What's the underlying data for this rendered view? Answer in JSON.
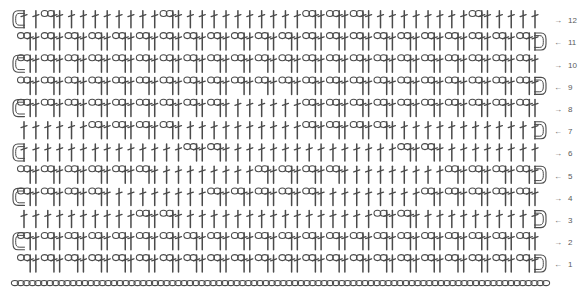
{
  "document": {
    "title": "Crochet Stitch Chart",
    "kind": "crochet-pattern-diagram",
    "background_color": "#ffffff",
    "stroke_color": "#4a4a4a",
    "label_color": "#5a5a5a"
  },
  "legend": {
    "symbols": [
      {
        "name": "chain-stitch",
        "abbr": "ch",
        "glyph": "oval",
        "label": "chain"
      },
      {
        "name": "double-crochet-stitch",
        "abbr": "dc",
        "glyph": "vertical-bar-with-crossbar",
        "label": "double crochet"
      },
      {
        "name": "turning-chain",
        "abbr": "t-ch",
        "glyph": "curved-chain-arc",
        "label": "turning chain"
      }
    ]
  },
  "chart_data": {
    "type": "diagram",
    "grid": false,
    "columns": 44,
    "row_count": 12,
    "foundation": {
      "name": "foundation-chain",
      "stitch": "ch",
      "count": 92,
      "label": "",
      "y": 283
    },
    "geometry": {
      "left_margin": 14,
      "right_margin": 545,
      "row_pitch": 22.2,
      "first_row_baseline": 272,
      "stitch_pitch": 12.05,
      "dc_height": 17,
      "chain_width": 11,
      "chain_height": 6
    },
    "row_numbers": [
      1,
      2,
      3,
      4,
      5,
      6,
      7,
      8,
      9,
      10,
      11,
      12
    ],
    "arrow_directions": [
      "left",
      "right",
      "left",
      "right",
      "left",
      "right",
      "left",
      "right",
      "left",
      "right",
      "left",
      "right"
    ],
    "arrow_glyphs": {
      "left": "←",
      "right": "→"
    },
    "rows": [
      {
        "number": 1,
        "direction": "left",
        "turn_side": "right",
        "cells": [
          "ch",
          "dc",
          "ch",
          "dc",
          "ch",
          "dc",
          "ch",
          "dc",
          "ch",
          "dc",
          "ch",
          "dc",
          "ch",
          "dc",
          "ch",
          "dc",
          "ch",
          "dc",
          "ch",
          "dc",
          "ch",
          "dc",
          "ch",
          "dc",
          "ch",
          "dc",
          "ch",
          "dc",
          "ch",
          "dc",
          "ch",
          "dc",
          "ch",
          "dc",
          "ch",
          "dc",
          "ch",
          "dc",
          "ch",
          "dc",
          "ch",
          "dc",
          "ch",
          "dc"
        ]
      },
      {
        "number": 2,
        "direction": "right",
        "turn_side": "left",
        "cells": [
          "ch",
          "dc",
          "ch",
          "dc",
          "ch",
          "dc",
          "ch",
          "dc",
          "ch",
          "dc",
          "ch",
          "dc",
          "ch",
          "dc",
          "ch",
          "dc",
          "ch",
          "dc",
          "ch",
          "dc",
          "ch",
          "dc",
          "ch",
          "dc",
          "ch",
          "dc",
          "ch",
          "dc",
          "ch",
          "dc",
          "ch",
          "dc",
          "ch",
          "dc",
          "ch",
          "dc",
          "ch",
          "dc",
          "ch",
          "dc",
          "ch",
          "dc",
          "ch",
          "dc"
        ]
      },
      {
        "number": 3,
        "direction": "left",
        "turn_side": "right",
        "cells": [
          "dc",
          "dc",
          "dc",
          "dc",
          "dc",
          "dc",
          "dc",
          "dc",
          "dc",
          "dc",
          "ch",
          "dc",
          "ch",
          "dc",
          "dc",
          "dc",
          "dc",
          "dc",
          "dc",
          "dc",
          "dc",
          "dc",
          "dc",
          "dc",
          "dc",
          "dc",
          "dc",
          "dc",
          "dc",
          "dc",
          "ch",
          "dc",
          "ch",
          "dc",
          "dc",
          "dc",
          "dc",
          "dc",
          "dc",
          "dc",
          "dc",
          "dc",
          "dc",
          "dc"
        ]
      },
      {
        "number": 4,
        "direction": "right",
        "turn_side": "left",
        "cells": [
          "ch",
          "dc",
          "ch",
          "dc",
          "ch",
          "dc",
          "ch",
          "dc",
          "dc",
          "dc",
          "dc",
          "dc",
          "dc",
          "dc",
          "dc",
          "dc",
          "ch",
          "dc",
          "ch",
          "dc",
          "ch",
          "dc",
          "ch",
          "dc",
          "ch",
          "dc",
          "dc",
          "dc",
          "dc",
          "dc",
          "dc",
          "dc",
          "dc",
          "dc",
          "ch",
          "dc",
          "ch",
          "dc",
          "ch",
          "dc",
          "ch",
          "dc",
          "ch",
          "dc"
        ]
      },
      {
        "number": 5,
        "direction": "left",
        "turn_side": "right",
        "cells": [
          "ch",
          "dc",
          "ch",
          "dc",
          "ch",
          "dc",
          "ch",
          "dc",
          "ch",
          "dc",
          "ch",
          "dc",
          "dc",
          "dc",
          "dc",
          "dc",
          "dc",
          "dc",
          "dc",
          "dc",
          "ch",
          "dc",
          "ch",
          "dc",
          "ch",
          "dc",
          "ch",
          "dc",
          "dc",
          "dc",
          "dc",
          "dc",
          "dc",
          "dc",
          "dc",
          "dc",
          "ch",
          "dc",
          "ch",
          "dc",
          "ch",
          "dc",
          "ch",
          "dc"
        ]
      },
      {
        "number": 6,
        "direction": "right",
        "turn_side": "left",
        "cells": [
          "dc",
          "dc",
          "dc",
          "dc",
          "dc",
          "dc",
          "dc",
          "dc",
          "dc",
          "dc",
          "dc",
          "dc",
          "dc",
          "dc",
          "ch",
          "dc",
          "ch",
          "dc",
          "dc",
          "dc",
          "dc",
          "dc",
          "dc",
          "dc",
          "dc",
          "dc",
          "dc",
          "dc",
          "dc",
          "dc",
          "dc",
          "dc",
          "ch",
          "dc",
          "ch",
          "dc",
          "dc",
          "dc",
          "dc",
          "dc",
          "dc",
          "dc",
          "dc",
          "dc"
        ]
      },
      {
        "number": 7,
        "direction": "left",
        "turn_side": "right",
        "cells": [
          "dc",
          "dc",
          "dc",
          "dc",
          "dc",
          "dc",
          "ch",
          "dc",
          "ch",
          "dc",
          "ch",
          "dc",
          "ch",
          "dc",
          "dc",
          "dc",
          "dc",
          "dc",
          "dc",
          "dc",
          "dc",
          "dc",
          "dc",
          "dc",
          "ch",
          "dc",
          "ch",
          "dc",
          "ch",
          "dc",
          "ch",
          "dc",
          "dc",
          "dc",
          "dc",
          "dc",
          "dc",
          "dc",
          "dc",
          "dc",
          "dc",
          "dc",
          "dc",
          "dc"
        ]
      },
      {
        "number": 8,
        "direction": "right",
        "turn_side": "left",
        "cells": [
          "ch",
          "dc",
          "ch",
          "dc",
          "ch",
          "dc",
          "ch",
          "dc",
          "ch",
          "dc",
          "ch",
          "dc",
          "ch",
          "dc",
          "ch",
          "dc",
          "ch",
          "dc",
          "dc",
          "dc",
          "dc",
          "dc",
          "dc",
          "dc",
          "ch",
          "dc",
          "ch",
          "dc",
          "ch",
          "dc",
          "ch",
          "dc",
          "ch",
          "dc",
          "ch",
          "dc",
          "ch",
          "dc",
          "ch",
          "dc",
          "ch",
          "dc",
          "ch",
          "dc"
        ]
      },
      {
        "number": 9,
        "direction": "left",
        "turn_side": "right",
        "cells": [
          "ch",
          "dc",
          "ch",
          "dc",
          "ch",
          "dc",
          "ch",
          "dc",
          "ch",
          "dc",
          "ch",
          "dc",
          "ch",
          "dc",
          "ch",
          "dc",
          "ch",
          "dc",
          "ch",
          "dc",
          "ch",
          "dc",
          "ch",
          "dc",
          "ch",
          "dc",
          "ch",
          "dc",
          "ch",
          "dc",
          "ch",
          "dc",
          "ch",
          "dc",
          "ch",
          "dc",
          "ch",
          "dc",
          "ch",
          "dc",
          "ch",
          "dc",
          "ch",
          "dc"
        ]
      },
      {
        "number": 10,
        "direction": "right",
        "turn_side": "left",
        "cells": [
          "ch",
          "dc",
          "ch",
          "dc",
          "ch",
          "dc",
          "ch",
          "dc",
          "ch",
          "dc",
          "ch",
          "dc",
          "ch",
          "dc",
          "ch",
          "dc",
          "ch",
          "dc",
          "ch",
          "dc",
          "ch",
          "dc",
          "ch",
          "dc",
          "ch",
          "dc",
          "ch",
          "dc",
          "ch",
          "dc",
          "ch",
          "dc",
          "ch",
          "dc",
          "ch",
          "dc",
          "ch",
          "dc",
          "ch",
          "dc",
          "ch",
          "dc",
          "ch",
          "dc"
        ]
      },
      {
        "number": 11,
        "direction": "left",
        "turn_side": "right",
        "cells": [
          "ch",
          "dc",
          "ch",
          "dc",
          "ch",
          "dc",
          "ch",
          "dc",
          "ch",
          "dc",
          "ch",
          "dc",
          "ch",
          "dc",
          "ch",
          "dc",
          "ch",
          "dc",
          "ch",
          "dc",
          "ch",
          "dc",
          "ch",
          "dc",
          "ch",
          "dc",
          "ch",
          "dc",
          "ch",
          "dc",
          "ch",
          "dc",
          "ch",
          "dc",
          "ch",
          "dc",
          "ch",
          "dc",
          "ch",
          "dc",
          "ch",
          "dc",
          "ch",
          "dc"
        ]
      },
      {
        "number": 12,
        "direction": "right",
        "turn_side": "left",
        "cells": [
          "dc",
          "dc",
          "ch",
          "dc",
          "dc",
          "dc",
          "dc",
          "dc",
          "dc",
          "dc",
          "dc",
          "dc",
          "ch",
          "dc",
          "dc",
          "dc",
          "dc",
          "dc",
          "dc",
          "dc",
          "dc",
          "dc",
          "dc",
          "dc",
          "ch",
          "dc",
          "ch",
          "dc",
          "ch",
          "dc",
          "dc",
          "dc",
          "dc",
          "dc",
          "dc",
          "dc",
          "dc",
          "dc",
          "ch",
          "dc",
          "dc",
          "dc",
          "dc",
          "dc"
        ]
      }
    ]
  }
}
